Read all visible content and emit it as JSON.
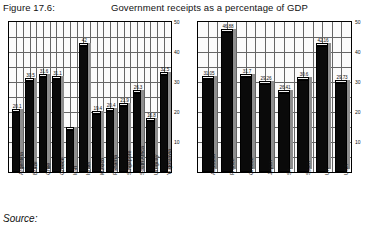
{
  "header": {
    "figure_label": "Figure 17.6:",
    "title": "Government receipts as a percentage of GDP"
  },
  "footer": {
    "source_label": "Source:"
  },
  "chart_data": [
    {
      "type": "bar",
      "id": "developing-countries",
      "title": "Government receipts as a percentage of GDP",
      "xlabel": "",
      "ylabel": "",
      "ylim": [
        0,
        50
      ],
      "yticks": [
        10,
        20,
        30,
        40,
        50
      ],
      "grid": true,
      "legend": "none",
      "categories": [
        "Argentina",
        "Brazil",
        "Chile",
        "Greece",
        "Iran",
        "Israel",
        "Mexico",
        "Panama",
        "Singapore",
        "South Africa",
        "Uruguay",
        "Yugoslavia"
      ],
      "values": [
        20.1,
        30.5,
        31.6,
        31.1,
        14.0,
        42.0,
        19.4,
        20.4,
        21.9,
        26.3,
        16.8,
        32.5
      ],
      "value_labels": [
        "20.1",
        "30.5",
        "31.6",
        "31.1",
        "",
        "42",
        "19.4",
        "20.4",
        "21.9",
        "26.3",
        "16.8",
        "32.5"
      ]
    },
    {
      "type": "bar",
      "id": "developed-countries",
      "title": "Government receipts as a percentage of GDP",
      "xlabel": "",
      "ylabel": "",
      "ylim": [
        0,
        50
      ],
      "yticks": [
        10,
        20,
        30,
        40,
        50
      ],
      "grid": true,
      "legend": "none",
      "categories": [
        "Australia",
        "France",
        "Greece",
        "Japan",
        "SA",
        "Spain",
        "UK",
        "USA"
      ],
      "values": [
        31.05,
        46.88,
        31.7,
        29.26,
        26.41,
        30.6,
        42.16,
        29.73
      ],
      "value_labels": [
        "31.05",
        "46.88",
        "31.7",
        "29.26",
        "26.41",
        "30.6",
        "42.16",
        "29.73"
      ]
    }
  ]
}
